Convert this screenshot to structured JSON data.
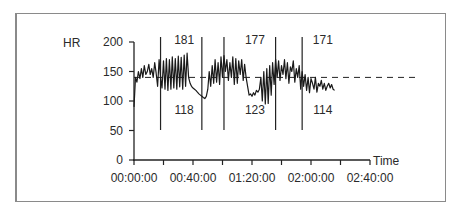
{
  "chart_data": {
    "type": "line",
    "title": "",
    "ylabel": "HR",
    "xlabel": "Time",
    "ylim": [
      0,
      200
    ],
    "yticks": [
      0,
      50,
      100,
      150,
      200
    ],
    "xlim_minutes": [
      0,
      160
    ],
    "xtick_labels": [
      "00:00:00",
      "00:40:00",
      "01:20:00",
      "02:00:00",
      "02:40:00"
    ],
    "xtick_minor_minutes": [
      0,
      20,
      40,
      60,
      80,
      100,
      120,
      140,
      160
    ],
    "grid": false,
    "reference_line": {
      "style": "dashed",
      "y": 140
    },
    "vertical_markers_minutes": [
      18,
      46,
      61,
      96,
      114
    ],
    "annotations": [
      {
        "text": "181",
        "x_min": 34,
        "y": 190,
        "position": "above"
      },
      {
        "text": "118",
        "x_min": 34,
        "y": 96,
        "position": "below"
      },
      {
        "text": "177",
        "x_min": 82,
        "y": 190,
        "position": "above"
      },
      {
        "text": "123",
        "x_min": 82,
        "y": 96,
        "position": "below"
      },
      {
        "text": "171",
        "x_min": 128,
        "y": 190,
        "position": "above"
      },
      {
        "text": "114",
        "x_min": 128,
        "y": 96,
        "position": "below"
      }
    ],
    "series": [
      {
        "name": "HR",
        "x_minutes": [
          0,
          1,
          2,
          3,
          4,
          5,
          6,
          7,
          8,
          9,
          10,
          11,
          12,
          13,
          14,
          15,
          16,
          17,
          18,
          19,
          20,
          21,
          22,
          23,
          24,
          25,
          26,
          27,
          28,
          29,
          30,
          31,
          32,
          33,
          34,
          35,
          36,
          37,
          38,
          39,
          40,
          41,
          42,
          43,
          44,
          45,
          46,
          47,
          48,
          49,
          50,
          51,
          52,
          53,
          54,
          55,
          56,
          57,
          58,
          59,
          60,
          61,
          62,
          63,
          64,
          65,
          66,
          67,
          68,
          69,
          70,
          71,
          72,
          73,
          74,
          75,
          76,
          77,
          78,
          79,
          80,
          81,
          82,
          83,
          84,
          85,
          86,
          87,
          88,
          89,
          90,
          91,
          92,
          93,
          94,
          95,
          96,
          97,
          98,
          99,
          100,
          101,
          102,
          103,
          104,
          105,
          106,
          107,
          108,
          109,
          110,
          111,
          112,
          113,
          114,
          115,
          116,
          117,
          118,
          119,
          120,
          121,
          122,
          123,
          124,
          125,
          126,
          127,
          128,
          129,
          130,
          131,
          132,
          133,
          134,
          135,
          136
        ],
        "values": [
          90,
          140,
          132,
          150,
          138,
          155,
          140,
          160,
          145,
          150,
          162,
          145,
          155,
          140,
          165,
          148,
          125,
          170,
          140,
          122,
          168,
          120,
          172,
          118,
          170,
          120,
          175,
          122,
          172,
          120,
          176,
          124,
          174,
          120,
          178,
          125,
          181,
          140,
          130,
          125,
          122,
          120,
          118,
          115,
          112,
          110,
          108,
          106,
          104,
          108,
          120,
          150,
          125,
          160,
          130,
          170,
          132,
          165,
          128,
          175,
          140,
          177,
          150,
          170,
          135,
          165,
          140,
          175,
          128,
          172,
          130,
          168,
          145,
          170,
          135,
          162,
          140,
          125,
          110,
          112,
          108,
          114,
          110,
          118,
          115,
          120,
          140,
          100,
          150,
          95,
          155,
          96,
          160,
          110,
          165,
          128,
          171,
          140,
          168,
          135,
          160,
          145,
          170,
          138,
          165,
          130,
          158,
          150,
          168,
          132,
          155,
          140,
          160,
          120,
          150,
          125,
          145,
          118,
          140,
          114,
          138,
          130,
          120,
          140,
          115,
          130,
          125,
          135,
          120,
          130,
          118,
          125,
          130,
          122,
          128,
          120,
          118
        ]
      }
    ]
  },
  "layout": {
    "plot_origin_x": 134,
    "plot_origin_y": 160,
    "px_per_minute": 1.475,
    "px_per_hr": 0.59,
    "axis_end_x": 370,
    "dash_end_x": 416,
    "marker_top_y": 37,
    "marker_bottom_y": 130
  }
}
